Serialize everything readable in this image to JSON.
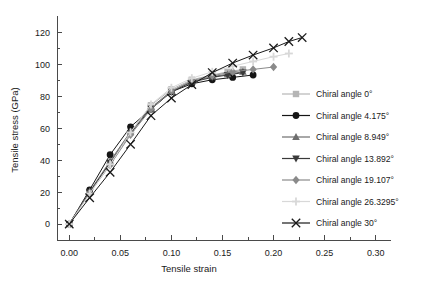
{
  "chart_data": {
    "type": "line",
    "title": "",
    "xlabel": "Tensile strain",
    "ylabel": "Tensile stress (GPa)",
    "xlim": [
      -0.012,
      0.315
    ],
    "ylim": [
      -10,
      128
    ],
    "xticks": [
      0.0,
      0.05,
      0.1,
      0.15,
      0.2,
      0.25,
      0.3
    ],
    "xticklabels": [
      "0.00",
      "0.05",
      "0.10",
      "0.15",
      "0.20",
      "0.25",
      "0.30"
    ],
    "yticks": [
      0,
      20,
      40,
      60,
      80,
      100,
      120
    ],
    "yticklabels": [
      "0",
      "20",
      "40",
      "60",
      "80",
      "100",
      "120"
    ],
    "minor_xticks": [
      0.025,
      0.075,
      0.125,
      0.175,
      0.225,
      0.275
    ],
    "minor_yticks": [
      10,
      30,
      50,
      70,
      90,
      110
    ],
    "grid": false,
    "legend_position": "right",
    "series": [
      {
        "name": "Chiral angle 0°",
        "marker": "square",
        "color": "#b5b5b5",
        "x": [
          0.0,
          0.02,
          0.04,
          0.06,
          0.08,
          0.1,
          0.12,
          0.14,
          0.155,
          0.17
        ],
        "y": [
          0.0,
          20.0,
          38.0,
          57.5,
          74.5,
          84.5,
          90.5,
          93.5,
          95.5,
          97.0
        ]
      },
      {
        "name": "Chiral angle 4.175°",
        "marker": "circle",
        "color": "#151515",
        "x": [
          0.0,
          0.02,
          0.04,
          0.06,
          0.08,
          0.1,
          0.12,
          0.14,
          0.16,
          0.18
        ],
        "y": [
          0.0,
          21.5,
          43.5,
          61.0,
          72.0,
          83.0,
          88.0,
          90.5,
          92.0,
          93.5
        ]
      },
      {
        "name": "Chiral angle 8.949°",
        "marker": "triangle-up",
        "color": "#6e6e6e",
        "x": [
          0.0,
          0.02,
          0.04,
          0.06,
          0.08,
          0.1,
          0.12,
          0.14,
          0.155,
          0.17
        ],
        "y": [
          0.0,
          20.5,
          39.5,
          58.0,
          73.0,
          83.5,
          89.5,
          92.5,
          94.0,
          95.5
        ]
      },
      {
        "name": "Chiral angle 13.892°",
        "marker": "triangle-down",
        "color": "#3a3a3a",
        "x": [
          0.0,
          0.02,
          0.04,
          0.06,
          0.08,
          0.1,
          0.12,
          0.14,
          0.155,
          0.17
        ],
        "y": [
          0.0,
          20.0,
          38.5,
          57.0,
          72.5,
          83.0,
          89.0,
          92.0,
          93.5,
          95.0
        ]
      },
      {
        "name": "Chiral angle 19.107°",
        "marker": "diamond",
        "color": "#8a8a8a",
        "x": [
          0.0,
          0.02,
          0.04,
          0.06,
          0.08,
          0.1,
          0.12,
          0.14,
          0.16,
          0.18,
          0.2
        ],
        "y": [
          0.0,
          19.5,
          37.0,
          56.0,
          72.0,
          83.5,
          90.0,
          93.0,
          95.5,
          97.0,
          98.5
        ]
      },
      {
        "name": "Chiral angle 26.3295°",
        "marker": "plus",
        "color": "#d8d8d8",
        "x": [
          0.0,
          0.02,
          0.04,
          0.06,
          0.08,
          0.1,
          0.12,
          0.14,
          0.16,
          0.18,
          0.2,
          0.215
        ],
        "y": [
          0.0,
          19.0,
          37.5,
          57.5,
          75.0,
          85.5,
          91.5,
          95.5,
          99.0,
          102.0,
          105.0,
          107.0
        ]
      },
      {
        "name": "Chiral angle 30°",
        "marker": "cross",
        "color": "#1a1a1a",
        "x": [
          0.0,
          0.02,
          0.04,
          0.06,
          0.08,
          0.1,
          0.12,
          0.14,
          0.16,
          0.18,
          0.2,
          0.215,
          0.228
        ],
        "y": [
          0.0,
          16.5,
          32.5,
          50.0,
          68.0,
          79.0,
          87.5,
          95.0,
          101.0,
          106.0,
          110.5,
          114.5,
          117.0
        ]
      }
    ]
  }
}
